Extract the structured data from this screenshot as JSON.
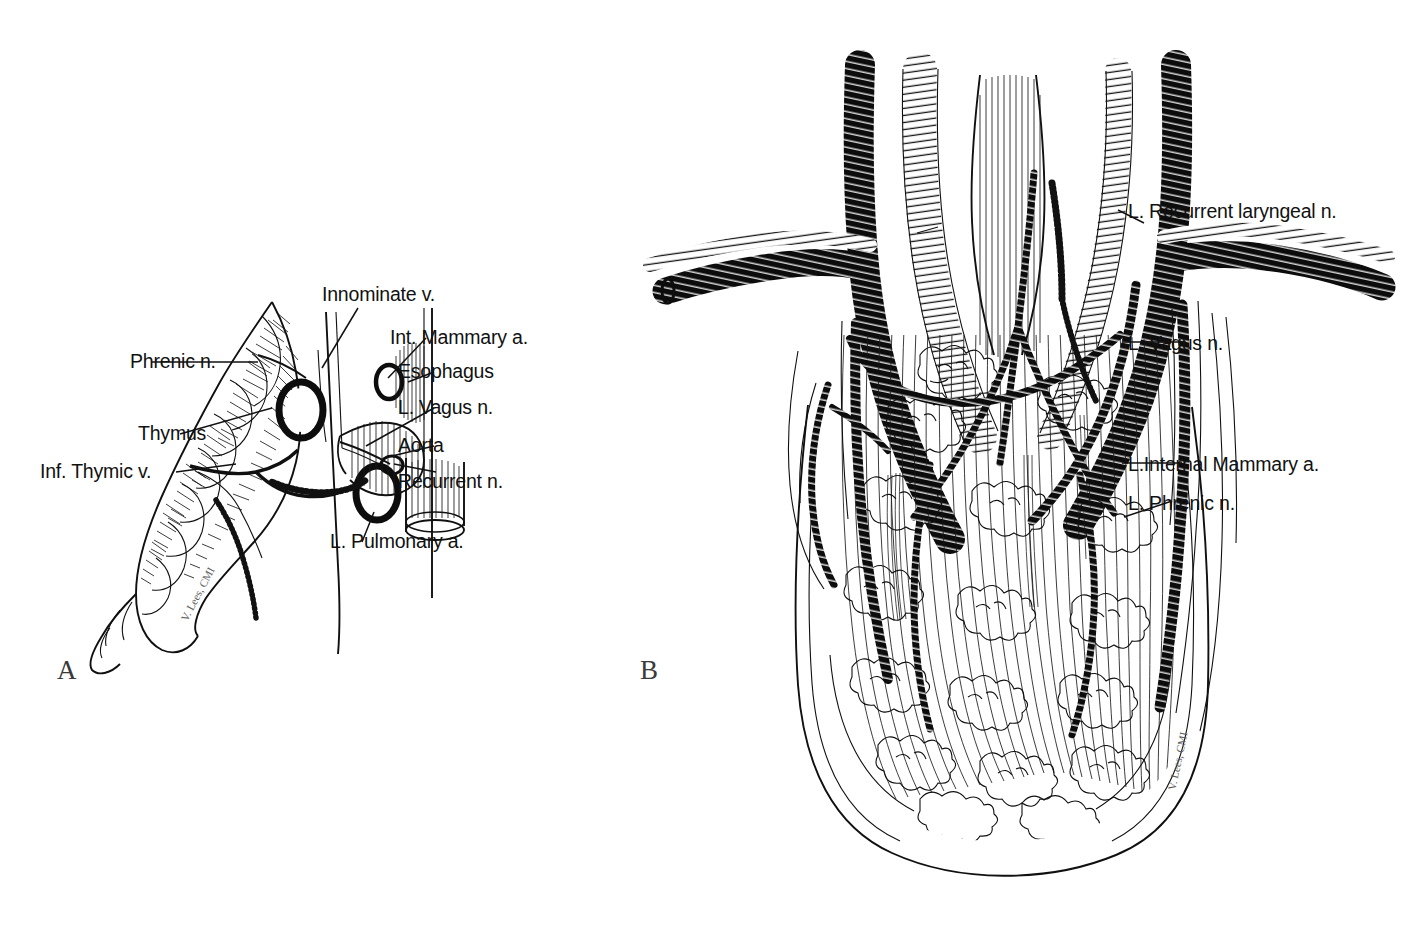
{
  "figure": {
    "type": "anatomical-line-illustration",
    "medium": "pen-and-ink",
    "background_color": "#ffffff",
    "frame_color": "#5a5a5a",
    "ink_color": "#101010",
    "panel_count": 2
  },
  "panels": [
    {
      "letter": "A",
      "title": "",
      "signature": "V. Lees, CMI",
      "labels": [
        {
          "text": "Innominate v.",
          "name": "label-innominate-vein"
        },
        {
          "text": "Int. Mammary a.",
          "name": "label-internal-mammary-artery"
        },
        {
          "text": "Phrenic n.",
          "name": "label-phrenic-nerve"
        },
        {
          "text": "Esophagus",
          "name": "label-esophagus"
        },
        {
          "text": "Thymus",
          "name": "label-thymus"
        },
        {
          "text": "L. Vagus n.",
          "name": "label-left-vagus-nerve"
        },
        {
          "text": "Aorta",
          "name": "label-aorta"
        },
        {
          "text": "Inf. Thymic v.",
          "name": "label-inferior-thymic-vein"
        },
        {
          "text": "Recurrent n.",
          "name": "label-recurrent-nerve"
        },
        {
          "text": "L. Pulmonary a.",
          "name": "label-left-pulmonary-artery"
        }
      ]
    },
    {
      "letter": "B",
      "title": "",
      "signature": "V. Lees, CMI",
      "labels": [
        {
          "text": "L. Recurrent laryngeal n.",
          "name": "label-left-recurrent-laryngeal-nerve"
        },
        {
          "text": "L. Vagus n.",
          "name": "label-left-vagus-nerve"
        },
        {
          "text": "L.Internal Mammary a.",
          "name": "label-left-internal-mammary-artery"
        },
        {
          "text": "L. Phrenic n.",
          "name": "label-left-phrenic-nerve"
        }
      ]
    }
  ],
  "caption": {
    "visible_fragment": ""
  }
}
